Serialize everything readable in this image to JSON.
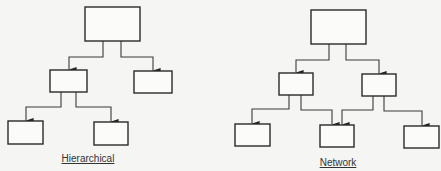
{
  "diagrams": [
    {
      "id": "hierarchical",
      "label": "Hierarchical",
      "nodes": [
        "root",
        "child-left",
        "child-right",
        "grandchild-left",
        "grandchild-right"
      ],
      "edges": [
        [
          "root",
          "child-left"
        ],
        [
          "root",
          "child-right"
        ],
        [
          "child-left",
          "grandchild-left"
        ],
        [
          "child-left",
          "grandchild-right"
        ]
      ]
    },
    {
      "id": "network",
      "label": "Network",
      "nodes": [
        "root",
        "mid-left",
        "mid-right",
        "bottom-left",
        "bottom-center",
        "bottom-right"
      ],
      "edges": [
        [
          "root",
          "mid-left"
        ],
        [
          "root",
          "mid-right"
        ],
        [
          "mid-left",
          "bottom-left"
        ],
        [
          "mid-left",
          "bottom-center"
        ],
        [
          "mid-right",
          "bottom-center"
        ],
        [
          "mid-right",
          "bottom-right"
        ]
      ]
    }
  ],
  "colors": {
    "background": "#f5f5f3",
    "line": "#2a2a2a"
  }
}
